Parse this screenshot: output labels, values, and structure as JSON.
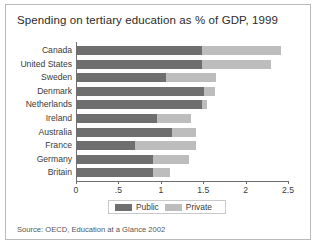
{
  "figure": {
    "title": "Spending on tertiary education as % of GDP, 1999",
    "source": "Source: OECD, Education at a Glance 2002"
  },
  "legend": {
    "public_label": "Public",
    "private_label": "Private"
  },
  "colors": {
    "public": "#6f6f6f",
    "private": "#bdbdbd",
    "axis": "#6e6e6e",
    "frame": "#b9b9b9",
    "background": "#ffffff",
    "text": "#3a3a3a"
  },
  "chart_data": {
    "type": "bar",
    "orientation": "horizontal",
    "stacked": true,
    "title": "Spending on tertiary education as % of GDP, 1999",
    "xlabel": "",
    "ylabel": "",
    "xlim": [
      0,
      2.5
    ],
    "xticks": [
      0,
      0.5,
      1,
      1.5,
      2,
      2.5
    ],
    "xticklabels": [
      "0",
      ".5",
      "1",
      "1.5",
      "2",
      "2.5"
    ],
    "grid": false,
    "legend_position": "bottom",
    "categories": [
      "Canada",
      "United States",
      "Sweden",
      "Denmark",
      "Netherlands",
      "Ireland",
      "Australia",
      "France",
      "Germany",
      "Britain"
    ],
    "series": [
      {
        "name": "Public",
        "color": "#6f6f6f",
        "values": [
          1.49,
          1.49,
          1.06,
          1.51,
          1.48,
          0.95,
          1.13,
          0.69,
          0.91,
          0.91
        ]
      },
      {
        "name": "Private",
        "color": "#bdbdbd",
        "values": [
          0.93,
          0.81,
          0.59,
          0.13,
          0.06,
          0.41,
          0.28,
          0.73,
          0.42,
          0.2
        ]
      }
    ],
    "totals": [
      2.42,
      2.3,
      1.65,
      1.64,
      1.54,
      1.36,
      1.41,
      1.42,
      1.33,
      1.11
    ],
    "source": "Source: OECD, Education at a Glance 2002"
  }
}
